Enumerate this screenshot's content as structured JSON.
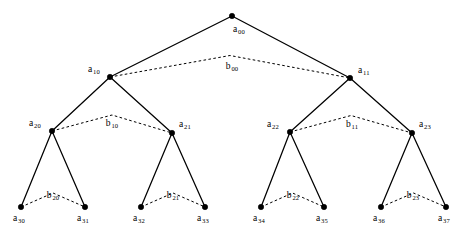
{
  "figure": {
    "type": "binary-tree-diagram",
    "width": 467,
    "height": 240,
    "background_color": "#ffffff",
    "ink_color": "#000000"
  },
  "nodes": [
    {
      "id": "a00",
      "base": "a",
      "sub": "00",
      "x": 232,
      "y": 16,
      "level": 0,
      "label_dx": 1,
      "label_dy": 9,
      "label_align": "left"
    },
    {
      "id": "a10",
      "base": "a",
      "sub": "10",
      "x": 110,
      "y": 77,
      "level": 1,
      "label_dx": -22,
      "label_dy": -12,
      "label_align": "left"
    },
    {
      "id": "a11",
      "base": "a",
      "sub": "11",
      "x": 350,
      "y": 78,
      "level": 1,
      "label_dx": 8,
      "label_dy": -12,
      "label_align": "left"
    },
    {
      "id": "a20",
      "base": "a",
      "sub": "20",
      "x": 52,
      "y": 131,
      "level": 2,
      "label_dx": -23,
      "label_dy": -12,
      "label_align": "left"
    },
    {
      "id": "a21",
      "base": "a",
      "sub": "21",
      "x": 172,
      "y": 133,
      "level": 2,
      "label_dx": 7,
      "label_dy": -13,
      "label_align": "left"
    },
    {
      "id": "a22",
      "base": "a",
      "sub": "22",
      "x": 290,
      "y": 132,
      "level": 2,
      "label_dx": -23,
      "label_dy": -12,
      "label_align": "left"
    },
    {
      "id": "a23",
      "base": "a",
      "sub": "23",
      "x": 412,
      "y": 133,
      "level": 2,
      "label_dx": 7,
      "label_dy": -13,
      "label_align": "left"
    },
    {
      "id": "a30",
      "base": "a",
      "sub": "30",
      "x": 21,
      "y": 207,
      "level": 3,
      "label_dx": -8,
      "label_dy": 7,
      "label_align": "left"
    },
    {
      "id": "a31",
      "base": "a",
      "sub": "31",
      "x": 85,
      "y": 207,
      "level": 3,
      "label_dx": -8,
      "label_dy": 7,
      "label_align": "left"
    },
    {
      "id": "a32",
      "base": "a",
      "sub": "32",
      "x": 141,
      "y": 207,
      "level": 3,
      "label_dx": -8,
      "label_dy": 7,
      "label_align": "left"
    },
    {
      "id": "a33",
      "base": "a",
      "sub": "33",
      "x": 205,
      "y": 207,
      "level": 3,
      "label_dx": -8,
      "label_dy": 7,
      "label_align": "left"
    },
    {
      "id": "a34",
      "base": "a",
      "sub": "34",
      "x": 261,
      "y": 207,
      "level": 3,
      "label_dx": -8,
      "label_dy": 7,
      "label_align": "left"
    },
    {
      "id": "a35",
      "base": "a",
      "sub": "35",
      "x": 324,
      "y": 207,
      "level": 3,
      "label_dx": -8,
      "label_dy": 7,
      "label_align": "left"
    },
    {
      "id": "a36",
      "base": "a",
      "sub": "36",
      "x": 381,
      "y": 207,
      "level": 3,
      "label_dx": -8,
      "label_dy": 7,
      "label_align": "left"
    },
    {
      "id": "a37",
      "base": "a",
      "sub": "37",
      "x": 446,
      "y": 207,
      "level": 3,
      "label_dx": -8,
      "label_dy": 7,
      "label_align": "left"
    }
  ],
  "solid_edges": [
    {
      "id": "e-a00-a10",
      "from": "a00",
      "to": "a10"
    },
    {
      "id": "e-a00-a11",
      "from": "a00",
      "to": "a11"
    },
    {
      "id": "e-a10-a20",
      "from": "a10",
      "to": "a20"
    },
    {
      "id": "e-a10-a21",
      "from": "a10",
      "to": "a21"
    },
    {
      "id": "e-a11-a22",
      "from": "a11",
      "to": "a22"
    },
    {
      "id": "e-a11-a23",
      "from": "a11",
      "to": "a23"
    },
    {
      "id": "e-a20-a30",
      "from": "a20",
      "to": "a30"
    },
    {
      "id": "e-a20-a31",
      "from": "a20",
      "to": "a31"
    },
    {
      "id": "e-a21-a32",
      "from": "a21",
      "to": "a32"
    },
    {
      "id": "e-a21-a33",
      "from": "a21",
      "to": "a33"
    },
    {
      "id": "e-a22-a34",
      "from": "a22",
      "to": "a34"
    },
    {
      "id": "e-a22-a35",
      "from": "a22",
      "to": "a35"
    },
    {
      "id": "e-a23-a36",
      "from": "a23",
      "to": "a36"
    },
    {
      "id": "e-a23-a37",
      "from": "a23",
      "to": "a37"
    }
  ],
  "dashed_edges": [
    {
      "id": "b00",
      "base": "b",
      "sub": "00",
      "from": "a10",
      "to": "a11",
      "apex_rise": 22,
      "label_x": 232,
      "label_y": 62
    },
    {
      "id": "b10",
      "base": "b",
      "sub": "10",
      "from": "a20",
      "to": "a21",
      "apex_rise": 17,
      "label_x": 112,
      "label_y": 119
    },
    {
      "id": "b11",
      "base": "b",
      "sub": "11",
      "from": "a22",
      "to": "a23",
      "apex_rise": 17,
      "label_x": 352,
      "label_y": 120
    },
    {
      "id": "b20",
      "base": "b",
      "sub": "20",
      "from": "a30",
      "to": "a31",
      "apex_rise": 14,
      "label_x": 53,
      "label_y": 191
    },
    {
      "id": "b21",
      "base": "b",
      "sub": "21",
      "from": "a32",
      "to": "a33",
      "apex_rise": 14,
      "label_x": 173,
      "label_y": 191
    },
    {
      "id": "b22",
      "base": "b",
      "sub": "22",
      "from": "a34",
      "to": "a35",
      "apex_rise": 14,
      "label_x": 293,
      "label_y": 191
    },
    {
      "id": "b23",
      "base": "b",
      "sub": "23",
      "from": "a36",
      "to": "a37",
      "apex_rise": 14,
      "label_x": 413,
      "label_y": 191
    }
  ]
}
